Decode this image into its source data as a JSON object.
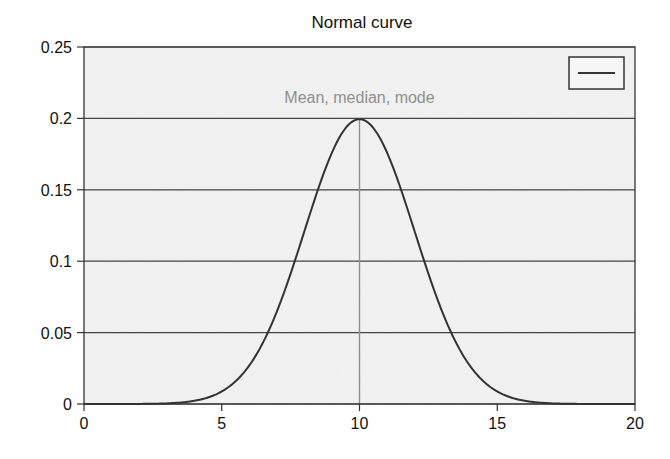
{
  "chart_data": {
    "type": "line",
    "title": "Normal curve",
    "xlabel": "",
    "ylabel": "",
    "xlim": [
      0,
      20
    ],
    "ylim": [
      0,
      0.25
    ],
    "x_ticks": [
      0,
      5,
      10,
      15,
      20
    ],
    "x_tick_labels": [
      "0",
      "5",
      "10",
      "15",
      "20"
    ],
    "y_ticks": [
      0,
      0.05,
      0.1,
      0.15,
      0.2,
      0.25
    ],
    "y_tick_labels": [
      "0",
      "0.05",
      "0.1",
      "0.15",
      "0.2",
      "0.25"
    ],
    "grid": "horizontal",
    "legend": {
      "position": "upper-right",
      "entries": [
        ""
      ]
    },
    "distribution": {
      "kind": "normal",
      "mean": 10,
      "sd": 2,
      "peak": 0.1995
    },
    "series": [
      {
        "name": "",
        "x": [
          0,
          1,
          2,
          3,
          3.5,
          4,
          4.5,
          5,
          5.5,
          6,
          6.5,
          7,
          7.5,
          8,
          8.5,
          9,
          9.5,
          10,
          10.5,
          11,
          11.5,
          12,
          12.5,
          13,
          13.5,
          14,
          14.5,
          15,
          15.5,
          16,
          16.5,
          17,
          18,
          19,
          20
        ],
        "values": [
          0.0,
          0.0,
          0.0001,
          0.0004,
          0.001,
          0.0022,
          0.0045,
          0.0088,
          0.0158,
          0.027,
          0.0431,
          0.0648,
          0.0913,
          0.121,
          0.1506,
          0.176,
          0.1933,
          0.1995,
          0.1933,
          0.176,
          0.1506,
          0.121,
          0.0913,
          0.0648,
          0.0431,
          0.027,
          0.0158,
          0.0088,
          0.0045,
          0.0022,
          0.001,
          0.0004,
          0.0001,
          0.0,
          0.0
        ]
      }
    ],
    "annotations": [
      {
        "text": "Mean, median, mode",
        "x": 10,
        "type": "vertical-line",
        "color": "#8f8f8f"
      }
    ],
    "colors": {
      "curve": "#333333",
      "grid": "#444444",
      "background": "#f3f3f3",
      "annotation": "#8f8f8f"
    }
  }
}
